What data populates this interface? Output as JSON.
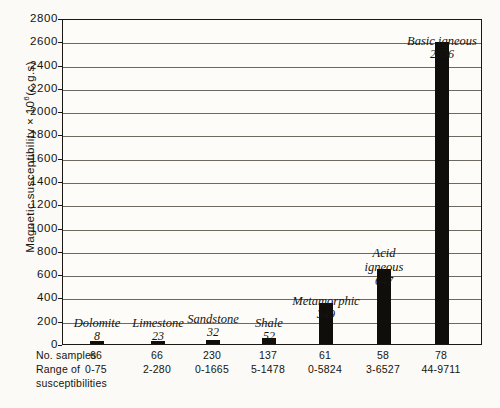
{
  "chart_data": {
    "type": "bar",
    "title": "",
    "xlabel": "",
    "ylabel": "Magnetic susceptibility × 10⁶ (c.g.s)",
    "ylim": [
      0,
      2800
    ],
    "ytick_step": 200,
    "yticks": [
      "0",
      "200",
      "400",
      "600",
      "800",
      "1000",
      "1200",
      "1400",
      "1600",
      "1800",
      "2000",
      "2200",
      "2400",
      "2600",
      "2800"
    ],
    "grid": true,
    "legend": "none",
    "categories": [
      "Dolomite",
      "Limestone",
      "Sandstone",
      "Shale",
      "Metamorphic",
      "Acid igneous",
      "Basic igneous"
    ],
    "values": [
      8,
      23,
      32,
      52,
      349,
      647,
      2596
    ],
    "annotations": [
      {
        "name": "Dolomite",
        "value": "8"
      },
      {
        "name": "Limestone",
        "value": "23"
      },
      {
        "name": "Sandstone",
        "value": "32"
      },
      {
        "name": "Shale",
        "value": "52"
      },
      {
        "name": "Metamorphic",
        "value": "349"
      },
      {
        "name": "Acid igneous",
        "name_line1": "Acid",
        "name_line2": "igneous",
        "value": "647"
      },
      {
        "name": "Basic igneous",
        "value": "2596"
      }
    ],
    "table": {
      "row_labels": [
        "No. samples",
        "Range of",
        "susceptibilities"
      ],
      "no_samples": [
        "66",
        "66",
        "230",
        "137",
        "61",
        "58",
        "78"
      ],
      "range_of_susceptibilities": [
        "0-75",
        "2-280",
        "0-1665",
        "5-1478",
        "0-5824",
        "3-6527",
        "44-9711"
      ]
    },
    "colors": {
      "bar": "#100e0b",
      "grid": "#6e6a62",
      "axis": "#1b1814",
      "background": "#fbfaf6"
    }
  }
}
